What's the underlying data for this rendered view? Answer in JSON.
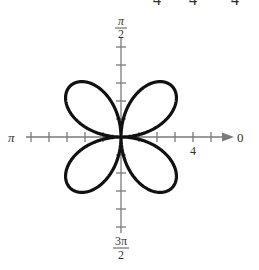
{
  "chart_data": {
    "type": "line",
    "subtype": "polar",
    "title": "",
    "equation": "r = 4 sin(2θ)",
    "curve": {
      "a": 4,
      "n": 2,
      "function": "sin",
      "petals": 4,
      "color": "#111111"
    },
    "axis_labels": {
      "right": "0",
      "top_num": "π",
      "top_den": "2",
      "left": "π",
      "bottom_num": "3π",
      "bottom_den": "2"
    },
    "tick_labels": [
      {
        "value": 4,
        "axis": "polar",
        "text": "4"
      }
    ],
    "radial_range": [
      -5,
      5
    ],
    "tick_spacing": 1,
    "sample_points": [
      {
        "theta_deg": 45,
        "r": 4
      },
      {
        "theta_deg": 135,
        "r": -4
      },
      {
        "theta_deg": 225,
        "r": 4
      },
      {
        "theta_deg": 315,
        "r": -4
      },
      {
        "theta_deg": 0,
        "r": 0
      },
      {
        "theta_deg": 90,
        "r": 0
      }
    ],
    "grid": false,
    "legend": null
  },
  "top_fragments": [
    "4",
    "4",
    "4"
  ],
  "colors": {
    "curve": "#111111",
    "axis": "#777777",
    "text": "#333333"
  }
}
